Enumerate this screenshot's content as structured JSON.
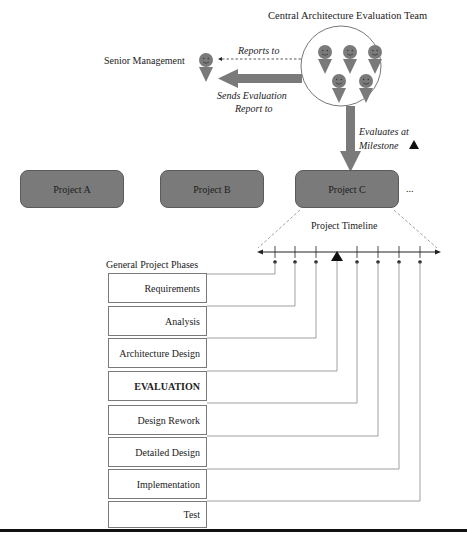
{
  "team": {
    "title": "Central Architecture Evaluation Team",
    "member_count": 5
  },
  "management": {
    "label": "Senior Management"
  },
  "arrows": {
    "reports_to": "Reports to",
    "sends_report_line1": "Sends Evaluation",
    "sends_report_line2": "Report to",
    "evaluates_line1": "Evaluates at",
    "evaluates_line2": "Milestone"
  },
  "projects": [
    {
      "label": "Project A"
    },
    {
      "label": "Project B"
    },
    {
      "label": "Project C"
    }
  ],
  "projects_more": "...",
  "timeline": {
    "title": "Project Timeline",
    "milestone_index": 3
  },
  "phases": {
    "heading": "General Project Phases",
    "items": [
      {
        "label": "Requirements"
      },
      {
        "label": "Analysis"
      },
      {
        "label": "Architecture Design"
      },
      {
        "label": "EVALUATION"
      },
      {
        "label": "Design Rework"
      },
      {
        "label": "Detailed Design"
      },
      {
        "label": "Implementation"
      },
      {
        "label": "Test"
      }
    ]
  },
  "colors": {
    "gray_fill": "#7a7a7a",
    "line": "#555555",
    "text": "#222222"
  }
}
